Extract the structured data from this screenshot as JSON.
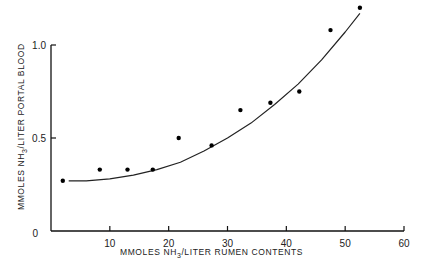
{
  "chart_data": {
    "type": "scatter",
    "title": "",
    "xlabel": "MMOLES NH3/LITER RUMEN CONTENTS",
    "ylabel": "MMOLES NH3/LITER PORTAL BLOOD",
    "xlabel_parts": {
      "pre": "MMOLES  NH",
      "sub": "3",
      "post": "/LITER  RUMEN  CONTENTS"
    },
    "ylabel_parts": {
      "pre": "MMOLES  NH",
      "sub": "3",
      "post": "/LITER  PORTAL  BLOOD"
    },
    "xlim": [
      0,
      60
    ],
    "ylim": [
      0,
      1.2
    ],
    "x_ticks": [
      10,
      20,
      30,
      40,
      50,
      60
    ],
    "x_tick_labels": [
      "10",
      "20",
      "30",
      "40",
      "50",
      "60"
    ],
    "y_ticks": [
      0,
      0.5,
      1.0
    ],
    "y_tick_labels": [
      "0",
      "0.5",
      "1.0"
    ],
    "grid": false,
    "legend": null,
    "series": [
      {
        "name": "observations",
        "kind": "scatter",
        "x": [
          2.0,
          8.3,
          13.0,
          17.3,
          21.7,
          27.3,
          32.2,
          37.3,
          42.2,
          47.5,
          52.5
        ],
        "y": [
          0.27,
          0.33,
          0.33,
          0.33,
          0.5,
          0.46,
          0.65,
          0.69,
          0.75,
          1.08,
          1.2
        ]
      },
      {
        "name": "fitted curve",
        "kind": "line",
        "x": [
          3,
          6,
          10,
          14,
          18,
          22,
          26,
          30,
          34,
          38,
          42,
          46,
          50,
          52.5
        ],
        "y": [
          0.27,
          0.27,
          0.28,
          0.3,
          0.33,
          0.37,
          0.43,
          0.5,
          0.58,
          0.68,
          0.79,
          0.92,
          1.07,
          1.17
        ]
      }
    ]
  }
}
